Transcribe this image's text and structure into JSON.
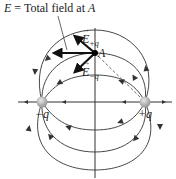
{
  "title_label": {
    "symbol": "E",
    "text": " = Total field at ",
    "point": "A"
  },
  "labels": {
    "point_a": "A",
    "e_plus_q": {
      "symbol": "E",
      "sub": "+q"
    },
    "e_minus_q": {
      "symbol": "E",
      "sub": "−q"
    },
    "neg_charge": "−q",
    "pos_charge": "+q"
  },
  "colors": {
    "line": "#333333",
    "vector": "#222222",
    "charge": "#b0b0b0"
  }
}
